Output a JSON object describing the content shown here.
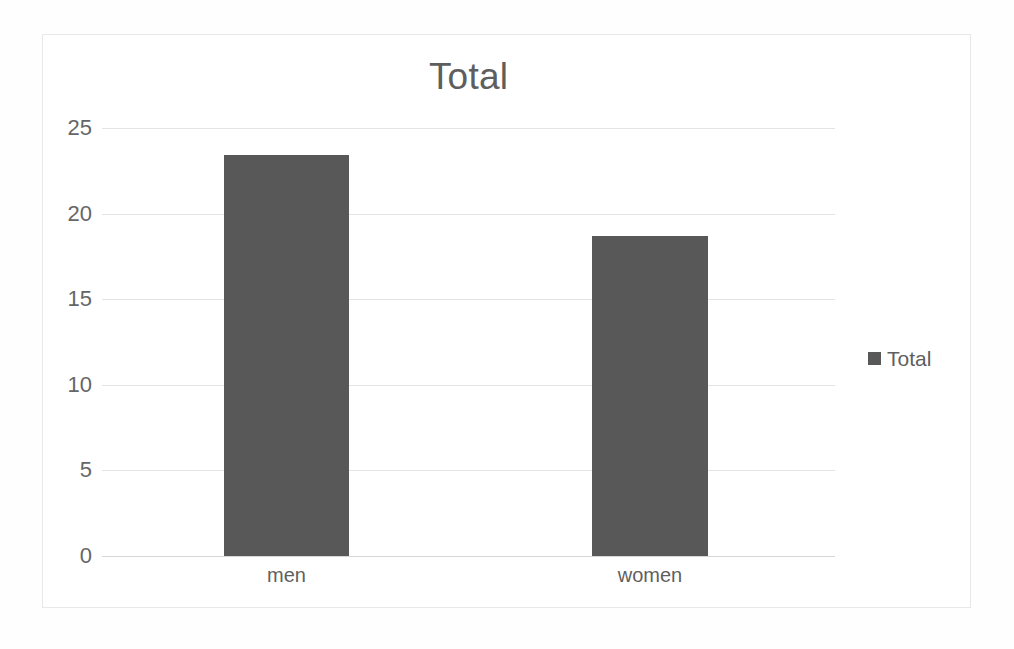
{
  "chart_data": {
    "type": "bar",
    "title": "Total",
    "categories": [
      "men",
      "women"
    ],
    "values": [
      23.4,
      18.7
    ],
    "series": [
      {
        "name": "Total",
        "values": [
          23.4,
          18.7
        ]
      }
    ],
    "xlabel": "",
    "ylabel": "",
    "ylim": [
      0,
      25
    ],
    "yticks": [
      "25",
      "20",
      "15",
      "10",
      "5",
      "0"
    ],
    "ytick_values": [
      25,
      20,
      15,
      10,
      5,
      0
    ],
    "grid": true,
    "legend": {
      "position": "right",
      "entries": [
        {
          "label": "Total",
          "color": "#585858"
        }
      ]
    },
    "colors": {
      "bar": "#585858",
      "grid": "#e4e4e4",
      "axis": "#d6d6d6",
      "text": "#5f5f5f",
      "title_text": "#5e5e5e",
      "frame_border": "#e8e8e8",
      "background": "#ffffff"
    }
  }
}
